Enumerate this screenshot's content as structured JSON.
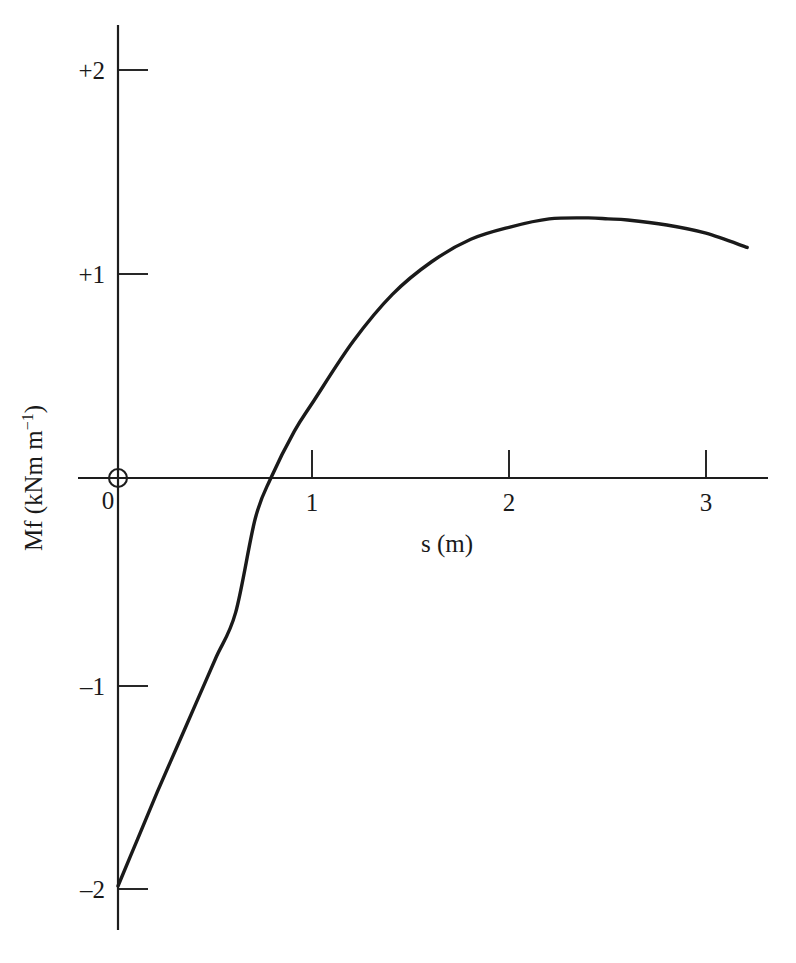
{
  "chart_data": {
    "type": "line",
    "title": "",
    "subtitle": "",
    "xlabel": "s (m)",
    "ylabel": "Mf (kNm m",
    "ylabel_exponent": "−1",
    "ylabel_close": ")",
    "ylabel_full": "Mf (kNm m⁻¹)",
    "xlim": [
      -0.2,
      3.32
    ],
    "ylim": [
      -2.22,
      2.22
    ],
    "grid": false,
    "legend": null,
    "x_ticks": [
      {
        "value": 1,
        "label": "1"
      },
      {
        "value": 2,
        "label": "2"
      },
      {
        "value": 3,
        "label": "3"
      }
    ],
    "y_ticks": [
      {
        "value": 2,
        "label": "+2"
      },
      {
        "value": 1,
        "label": "+1"
      },
      {
        "value": -1,
        "label": "–1"
      },
      {
        "value": -2,
        "label": "–2"
      }
    ],
    "origin_label": "0",
    "origin_marker": "circle",
    "series": [
      {
        "name": "Mf",
        "x": [
          0.0,
          0.1,
          0.2,
          0.3,
          0.4,
          0.5,
          0.6,
          0.7,
          0.78,
          0.9,
          1.0,
          1.2,
          1.4,
          1.6,
          1.8,
          2.0,
          2.2,
          2.4,
          2.5,
          2.6,
          2.8,
          3.0,
          3.21
        ],
        "y": [
          -2.0,
          -1.77,
          -1.54,
          -1.32,
          -1.1,
          -0.88,
          -0.66,
          -0.2,
          0.0,
          0.23,
          0.38,
          0.67,
          0.9,
          1.06,
          1.17,
          1.23,
          1.27,
          1.275,
          1.27,
          1.265,
          1.24,
          1.2,
          1.13
        ]
      }
    ],
    "annotations": {
      "zero_crossing_s": 0.78,
      "start_value": -2.0,
      "peak_s": 2.5,
      "peak_value": 1.27,
      "end_s": 3.21,
      "end_value": 1.13
    },
    "colors": {
      "curve": "#1a1a1a",
      "axis": "#1d1d1d",
      "background": "#ffffff"
    }
  }
}
